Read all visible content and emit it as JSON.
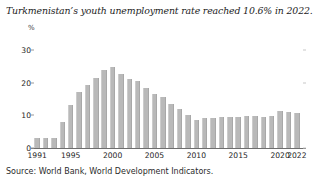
{
  "chart_data": {
    "type": "bar",
    "title": "Turkmenistan’s youth unemployment rate reached 10.6% in 2022.",
    "xlabel": "",
    "ylabel": "%",
    "ylim": [
      0,
      33
    ],
    "yticks": [
      0,
      10,
      20,
      30
    ],
    "xticks": [
      1991,
      1995,
      2000,
      2005,
      2010,
      2015,
      2020,
      2022
    ],
    "grid": false,
    "legend": null,
    "source": "Source: World Bank, World Development Indicators.",
    "bar_color": "#b9b9b9",
    "categories": [
      "1991",
      "1992",
      "1993",
      "1994",
      "1995",
      "1996",
      "1997",
      "1998",
      "1999",
      "2000",
      "2001",
      "2002",
      "2003",
      "2004",
      "2005",
      "2006",
      "2007",
      "2008",
      "2009",
      "2010",
      "2011",
      "2012",
      "2013",
      "2014",
      "2015",
      "2016",
      "2017",
      "2018",
      "2019",
      "2020",
      "2021",
      "2022"
    ],
    "values": [
      3.0,
      3.2,
      3.2,
      8.0,
      13.1,
      17.2,
      19.4,
      21.4,
      23.9,
      24.8,
      22.6,
      21.2,
      20.4,
      18.2,
      16.6,
      15.5,
      13.6,
      11.8,
      10.2,
      8.6,
      9.1,
      9.3,
      9.4,
      9.4,
      9.5,
      9.7,
      9.7,
      9.6,
      9.7,
      11.2,
      11.0,
      10.6
    ]
  }
}
